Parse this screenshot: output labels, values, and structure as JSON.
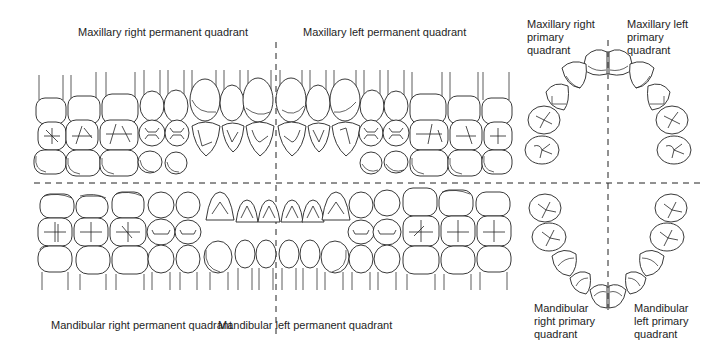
{
  "figure": {
    "type": "dental quadrant diagram",
    "dividers": {
      "style": "dashed",
      "color": "#222222"
    }
  },
  "labels": {
    "max_right_perm": "Maxillary right permanent quadrant",
    "max_left_perm": "Maxillary left permanent quadrant",
    "mand_right_perm": "Mandibular right permanent quadrant",
    "mand_left_perm": "Mandibular left permanent quadrant",
    "max_right_prim": "Maxillary right\nprimary\nquadrant",
    "max_left_prim": "Maxillary left\nprimary\nquadrant",
    "mand_right_prim": "Mandibular\nright primary\nquadrant",
    "mand_left_prim": "Mandibular\nleft primary\nquadrant"
  },
  "permanent_dentition": {
    "teeth_per_quadrant": 8,
    "maxillary_arch": [
      "molar",
      "molar",
      "molar",
      "premolar",
      "premolar",
      "canine",
      "lateral incisor",
      "central incisor"
    ],
    "mandibular_arch": [
      "molar",
      "molar",
      "molar",
      "premolar",
      "premolar",
      "canine",
      "lateral incisor",
      "central incisor"
    ]
  },
  "primary_dentition": {
    "teeth_per_quadrant": 5,
    "arch": [
      "central incisor",
      "lateral incisor",
      "canine",
      "first molar",
      "second molar"
    ]
  }
}
